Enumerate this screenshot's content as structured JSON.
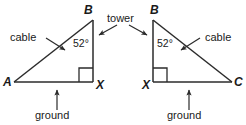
{
  "figure": {
    "type": "geometry-diagram",
    "stroke_color": "#2b2b2b",
    "text_color": "#1a1a1a",
    "background_color": "#ffffff"
  },
  "left_triangle": {
    "name": "triangle-ABX",
    "vertices": {
      "a": "A",
      "b": "B",
      "x": "X"
    },
    "angle": "52°",
    "cable_label": "cable",
    "ground_label": "ground",
    "right_angle_at": "X"
  },
  "right_triangle": {
    "name": "triangle-BXC",
    "vertices": {
      "b": "B",
      "x": "X",
      "c": "C"
    },
    "angle": "52°",
    "cable_label": "cable",
    "ground_label": "ground",
    "right_angle_at": "X"
  },
  "shared": {
    "tower_label": "tower"
  }
}
